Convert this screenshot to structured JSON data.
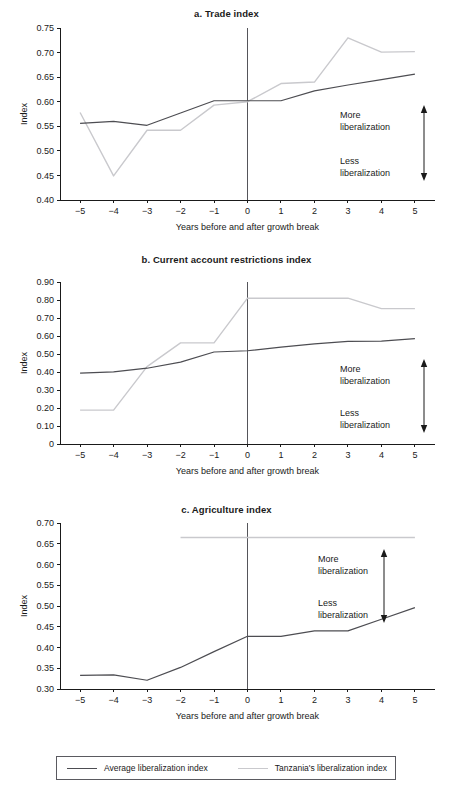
{
  "figure": {
    "legend": {
      "items": [
        {
          "label": "Average liberalization index",
          "color": "#4d4d52",
          "key": "average"
        },
        {
          "label": "Tanzania's liberalization index",
          "color": "#c9c9cd",
          "key": "tanzania"
        }
      ]
    },
    "annotation": {
      "more": "More",
      "more_second": "liberalization",
      "less": "Less",
      "less_second": "liberalization"
    },
    "xlabel": "Years before and after growth break",
    "ylabel": "Index"
  },
  "chart_data": [
    {
      "id": "a",
      "type": "line",
      "title": "a. Trade index",
      "xlabel": "Years before and after growth break",
      "ylabel": "Index",
      "x": [
        -5,
        -4,
        -3,
        -2,
        -1,
        0,
        1,
        2,
        3,
        4,
        5
      ],
      "xtick_labels": [
        "−5",
        "−4",
        "−3",
        "−2",
        "−1",
        "0",
        "1",
        "2",
        "3",
        "4",
        "5"
      ],
      "xlim": [
        -5.6,
        5.6
      ],
      "ylim": [
        0.4,
        0.75
      ],
      "yticks": [
        0.4,
        0.45,
        0.5,
        0.55,
        0.6,
        0.65,
        0.7,
        0.75
      ],
      "ytick_labels": [
        "0.40",
        "0.45",
        "0.50",
        "0.55",
        "0.60",
        "0.65",
        "0.70",
        "0.75"
      ],
      "grid": false,
      "vline_x": 0,
      "legend_position": "figure-bottom",
      "series": [
        {
          "name": "Average liberalization index",
          "key": "average",
          "color": "#4d4d52",
          "values": [
            0.556,
            0.56,
            0.552,
            0.577,
            0.602,
            0.602,
            0.602,
            0.622,
            0.634,
            0.645,
            0.656
          ]
        },
        {
          "name": "Tanzania's liberalization index",
          "key": "tanzania",
          "color": "#c9c9cd",
          "values": [
            0.578,
            0.449,
            0.542,
            0.542,
            0.593,
            0.6,
            0.637,
            0.64,
            0.73,
            0.701,
            0.702
          ]
        }
      ],
      "annotations": [
        {
          "text": "More liberalization",
          "direction": "up"
        },
        {
          "text": "Less liberalization",
          "direction": "down"
        }
      ]
    },
    {
      "id": "b",
      "type": "line",
      "title": "b. Current account restrictions index",
      "xlabel": "Years before and after growth break",
      "ylabel": "Index",
      "x": [
        -5,
        -4,
        -3,
        -2,
        -1,
        0,
        1,
        2,
        3,
        4,
        5
      ],
      "xtick_labels": [
        "−5",
        "−4",
        "−3",
        "−2",
        "−1",
        "0",
        "1",
        "2",
        "3",
        "4",
        "5"
      ],
      "xlim": [
        -5.6,
        5.6
      ],
      "ylim": [
        0,
        0.9
      ],
      "yticks": [
        0,
        0.1,
        0.2,
        0.3,
        0.4,
        0.5,
        0.6,
        0.7,
        0.8,
        0.9
      ],
      "ytick_labels": [
        "0",
        "0.10",
        "0.20",
        "0.30",
        "0.40",
        "0.50",
        "0.60",
        "0.70",
        "0.80",
        "0.90"
      ],
      "grid": false,
      "vline_x": 0,
      "legend_position": "figure-bottom",
      "series": [
        {
          "name": "Average liberalization index",
          "key": "average",
          "color": "#4d4d52",
          "values": [
            0.394,
            0.401,
            0.421,
            0.455,
            0.511,
            0.518,
            0.538,
            0.556,
            0.57,
            0.572,
            0.585
          ]
        },
        {
          "name": "Tanzania's liberalization index",
          "key": "tanzania",
          "color": "#c9c9cd",
          "values": [
            0.188,
            0.188,
            0.43,
            0.562,
            0.562,
            0.81,
            0.81,
            0.81,
            0.81,
            0.752,
            0.752
          ]
        }
      ],
      "annotations": [
        {
          "text": "More liberalization",
          "direction": "up"
        },
        {
          "text": "Less liberalization",
          "direction": "down"
        }
      ]
    },
    {
      "id": "c",
      "type": "line",
      "title": "c. Agriculture index",
      "xlabel": "Years before and after growth break",
      "ylabel": "Index",
      "x": [
        -5,
        -4,
        -3,
        -2,
        -1,
        0,
        1,
        2,
        3,
        4,
        5
      ],
      "xtick_labels": [
        "−5",
        "−4",
        "−3",
        "−2",
        "−1",
        "0",
        "1",
        "2",
        "3",
        "4",
        "5"
      ],
      "xlim": [
        -5.6,
        5.6
      ],
      "ylim": [
        0.3,
        0.7
      ],
      "yticks": [
        0.3,
        0.35,
        0.4,
        0.45,
        0.5,
        0.55,
        0.6,
        0.65,
        0.7
      ],
      "ytick_labels": [
        "0.30",
        "0.35",
        "0.40",
        "0.45",
        "0.50",
        "0.55",
        "0.60",
        "0.65",
        "0.70"
      ],
      "grid": false,
      "vline_x": 0,
      "legend_position": "figure-bottom",
      "series": [
        {
          "name": "Average liberalization index",
          "key": "average",
          "color": "#4d4d52",
          "values": [
            0.333,
            0.334,
            0.321,
            0.352,
            0.39,
            0.427,
            0.427,
            0.44,
            0.44,
            0.468,
            0.496
          ]
        },
        {
          "name": "Tanzania's liberalization index",
          "key": "tanzania",
          "color": "#c9c9cd",
          "x": [
            -2,
            -1,
            0,
            1,
            2,
            3,
            4,
            5
          ],
          "values": [
            0.665,
            0.665,
            0.665,
            0.665,
            0.665,
            0.665,
            0.665,
            0.665
          ]
        }
      ],
      "annotations": [
        {
          "text": "More liberalization",
          "direction": "up"
        },
        {
          "text": "Less liberalization",
          "direction": "down"
        }
      ]
    }
  ]
}
